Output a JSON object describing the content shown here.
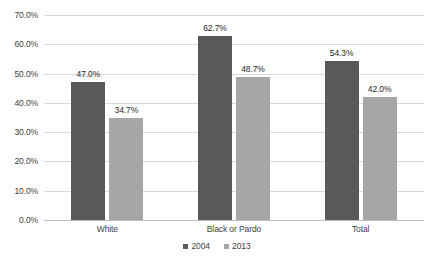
{
  "chart_data": {
    "type": "bar",
    "title": "",
    "subtitle": "",
    "xlabel": "",
    "ylabel": "",
    "categories": [
      "White",
      "Black or Pardo",
      "Total"
    ],
    "series": [
      {
        "name": "2004",
        "color": "#595959",
        "values": [
          47.0,
          62.7,
          54.3
        ],
        "labels": [
          "47.0%",
          "62.7%",
          "54.3%"
        ]
      },
      {
        "name": "2013",
        "color": "#a6a6a6",
        "values": [
          34.7,
          48.7,
          42.0
        ],
        "labels": [
          "34.7%",
          "48.7%",
          "42.0%"
        ]
      }
    ],
    "ylim": [
      0,
      70
    ],
    "ytick_values": [
      0,
      10,
      20,
      30,
      40,
      50,
      60,
      70
    ],
    "ytick_labels": [
      "0.0%",
      "10.0%",
      "20.0%",
      "30.0%",
      "40.0%",
      "50.0%",
      "60.0%",
      "70.0%"
    ],
    "grid": true,
    "legend_position": "bottom",
    "value_labels_shown": true,
    "colors": {
      "background": "#ffffff",
      "gridline": "#d9d9d9",
      "axis": "#bfbfbf",
      "tick_text": "#404040",
      "label_text": "#262626"
    }
  }
}
